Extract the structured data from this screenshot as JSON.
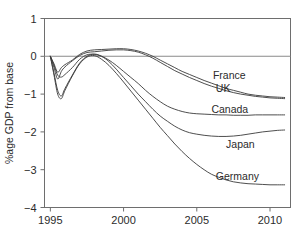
{
  "chart_data": {
    "type": "line",
    "title": "",
    "xlabel": "",
    "ylabel": "%age GDP from base",
    "xlim": [
      1994.6,
      2011.4
    ],
    "ylim": [
      -4,
      1
    ],
    "grid": false,
    "legend_position": "inline-right",
    "xticks": [
      1995,
      2000,
      2005,
      2010
    ],
    "xtick_labels": [
      "1995",
      "2000",
      "2005",
      "2010"
    ],
    "yticks": [
      1,
      0,
      -1,
      -2,
      -3,
      -4
    ],
    "ytick_labels": [
      "1",
      "0",
      "−1",
      "−2",
      "−3",
      "−4"
    ],
    "zero_reference_line": 0,
    "x": [
      1995.0,
      1995.25,
      1995.5,
      1995.75,
      1996.0,
      1996.5,
      1997.0,
      1997.5,
      1998.0,
      1998.5,
      1999.0,
      1999.5,
      2000.0,
      2000.5,
      2001.0,
      2001.5,
      2002.0,
      2002.5,
      2003.0,
      2003.5,
      2004.0,
      2004.5,
      2005.0,
      2005.5,
      2006.0,
      2006.5,
      2007.0,
      2007.5,
      2008.0,
      2008.5,
      2009.0,
      2009.5,
      2010.0,
      2010.5,
      2011.0
    ],
    "series": [
      {
        "name": "France",
        "label": "France",
        "values": [
          0.0,
          -0.2,
          -0.42,
          -0.3,
          -0.22,
          -0.1,
          0.05,
          0.14,
          0.17,
          0.18,
          0.19,
          0.2,
          0.2,
          0.18,
          0.14,
          0.08,
          0.0,
          -0.1,
          -0.2,
          -0.3,
          -0.4,
          -0.48,
          -0.56,
          -0.64,
          -0.71,
          -0.78,
          -0.85,
          -0.9,
          -0.95,
          -1.0,
          -1.03,
          -1.05,
          -1.07,
          -1.08,
          -1.09
        ]
      },
      {
        "name": "UK",
        "label": "UK",
        "values": [
          0.0,
          -0.3,
          -0.6,
          -0.4,
          -0.28,
          -0.12,
          0.02,
          0.1,
          0.12,
          0.14,
          0.16,
          0.17,
          0.17,
          0.15,
          0.11,
          0.04,
          -0.05,
          -0.16,
          -0.27,
          -0.38,
          -0.47,
          -0.56,
          -0.64,
          -0.72,
          -0.79,
          -0.85,
          -0.91,
          -0.96,
          -1.0,
          -1.03,
          -1.06,
          -1.08,
          -1.1,
          -1.11,
          -1.12
        ]
      },
      {
        "name": "Canada",
        "label": "Canada",
        "values": [
          0.0,
          -0.24,
          -0.5,
          -0.55,
          -0.48,
          -0.3,
          -0.08,
          0.04,
          0.05,
          0.0,
          -0.1,
          -0.24,
          -0.4,
          -0.56,
          -0.72,
          -0.9,
          -1.06,
          -1.2,
          -1.32,
          -1.4,
          -1.46,
          -1.5,
          -1.52,
          -1.53,
          -1.54,
          -1.55,
          -1.55,
          -1.56,
          -1.56,
          -1.56,
          -1.55,
          -1.55,
          -1.55,
          -1.55,
          -1.55
        ]
      },
      {
        "name": "Japan",
        "label": "Japan",
        "values": [
          0.0,
          -0.45,
          -0.9,
          -1.05,
          -0.85,
          -0.5,
          -0.18,
          0.0,
          0.06,
          0.0,
          -0.14,
          -0.34,
          -0.56,
          -0.78,
          -1.0,
          -1.2,
          -1.4,
          -1.58,
          -1.72,
          -1.85,
          -1.95,
          -2.02,
          -2.06,
          -2.09,
          -2.11,
          -2.12,
          -2.12,
          -2.11,
          -2.09,
          -2.06,
          -2.03,
          -2.0,
          -1.98,
          -1.96,
          -1.95
        ]
      },
      {
        "name": "Germany",
        "label": "Germany",
        "values": [
          0.0,
          -0.5,
          -1.0,
          -1.12,
          -0.9,
          -0.52,
          -0.2,
          -0.02,
          0.02,
          -0.08,
          -0.24,
          -0.45,
          -0.68,
          -0.92,
          -1.16,
          -1.4,
          -1.64,
          -1.88,
          -2.1,
          -2.32,
          -2.52,
          -2.7,
          -2.86,
          -3.0,
          -3.12,
          -3.2,
          -3.27,
          -3.32,
          -3.35,
          -3.37,
          -3.38,
          -3.39,
          -3.4,
          -3.4,
          -3.4
        ]
      }
    ],
    "series_label_positions": [
      {
        "name": "France",
        "x": 2006.1,
        "y": -0.52
      },
      {
        "name": "UK",
        "x": 2006.3,
        "y": -0.86
      },
      {
        "name": "Canada",
        "x": 2006.0,
        "y": -1.42
      },
      {
        "name": "Japan",
        "x": 2007.0,
        "y": -2.34
      },
      {
        "name": "Germany",
        "x": 2006.3,
        "y": -3.18
      }
    ],
    "colors": {
      "line": "#3a3a3a",
      "axis": "#6e6e6e",
      "zero_line": "#8a8a8a",
      "text": "#2b2b2b",
      "background": "#ffffff"
    }
  }
}
